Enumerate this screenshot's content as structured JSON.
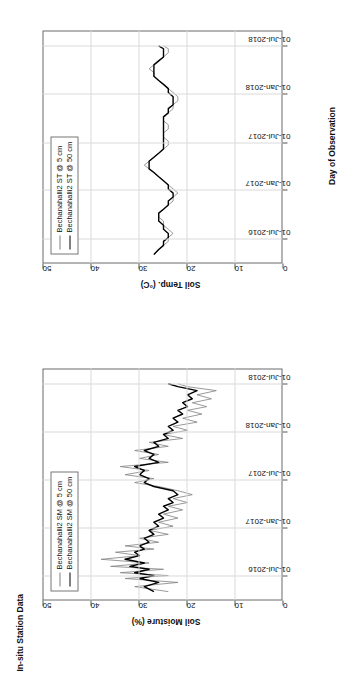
{
  "figure": {
    "title": "In-situ Station Data",
    "orientation": "rotated-90-ccw",
    "background": "#ffffff"
  },
  "colors": {
    "series_shallow": "#808080",
    "series_deep": "#000000",
    "axis": "#6b6b6b",
    "grid": "#d9d9d9",
    "text": "#111111"
  },
  "panels": [
    {
      "id": "soil-moisture",
      "title": "In-situ Station Data",
      "ylabel": "Soil Moisture (%)",
      "xlabel": "",
      "yticks": [
        "0",
        "10",
        "20",
        "30",
        "40",
        "50"
      ],
      "xticks": [
        "01-Jul-2016",
        "01-Jan-2017",
        "01-Jul-2017",
        "01-Jan-2018",
        "01-Jul-2018"
      ],
      "legend": [
        {
          "label": "Bechanahalli2 SM @ 5 cm",
          "color": "#808080"
        },
        {
          "label": "Bechanahalli2 SM @ 50 cm",
          "color": "#000000"
        }
      ]
    },
    {
      "id": "soil-temperature",
      "title": "",
      "ylabel": "Soil Temp. (°C)",
      "xlabel": "Day of Observation",
      "yticks": [
        "0",
        "10",
        "20",
        "30",
        "40",
        "50"
      ],
      "xticks": [
        "01-Jul-2016",
        "01-Jan-2017",
        "01-Jul-2017",
        "01-Jan-2018",
        "01-Jul-2018"
      ],
      "legend": [
        {
          "label": "Bechanahalli2 ST @ 5 cm",
          "color": "#808080"
        },
        {
          "label": "Bechanahalli2 ST @ 50 cm",
          "color": "#000000"
        }
      ]
    }
  ],
  "chart_data": [
    {
      "type": "line",
      "title": "In-situ Station Data",
      "xlabel": "",
      "ylabel": "Soil Moisture (%)",
      "ylim": [
        0,
        50
      ],
      "yticks": [
        0,
        10,
        20,
        30,
        40,
        50
      ],
      "xlim": [
        "2016-04-01",
        "2018-09-01"
      ],
      "xticks": [
        "01-Jul-2016",
        "01-Jan-2017",
        "01-Jul-2017",
        "01-Jan-2018",
        "01-Jul-2018"
      ],
      "grid": true,
      "legend_position": "top-left",
      "series": [
        {
          "name": "Bechanahalli2 SM @ 5 cm",
          "color": "#808080",
          "x": [
            "2016-05-01",
            "2016-05-20",
            "2016-06-05",
            "2016-06-20",
            "2016-07-01",
            "2016-07-12",
            "2016-07-25",
            "2016-08-05",
            "2016-08-18",
            "2016-09-01",
            "2016-09-15",
            "2016-09-28",
            "2016-10-10",
            "2016-10-22",
            "2016-11-05",
            "2016-11-20",
            "2016-12-05",
            "2016-12-20",
            "2017-01-05",
            "2017-01-20",
            "2017-02-05",
            "2017-02-20",
            "2017-03-08",
            "2017-03-22",
            "2017-04-05",
            "2017-04-20",
            "2017-05-05",
            "2017-05-20",
            "2017-06-05",
            "2017-06-20",
            "2017-07-05",
            "2017-07-20",
            "2017-08-05",
            "2017-08-20",
            "2017-09-05",
            "2017-09-20",
            "2017-10-05",
            "2017-10-20",
            "2017-11-05",
            "2017-11-20",
            "2017-12-05",
            "2017-12-20",
            "2018-01-05",
            "2018-01-20",
            "2018-02-05",
            "2018-02-20",
            "2018-03-08",
            "2018-03-22",
            "2018-04-05",
            "2018-04-20",
            "2018-05-05",
            "2018-05-20",
            "2018-06-05",
            "2018-06-20",
            "2018-07-01"
          ],
          "y": [
            24,
            31,
            22,
            33,
            24,
            34,
            25,
            36,
            28,
            38,
            30,
            35,
            27,
            33,
            26,
            30,
            24,
            28,
            23,
            26,
            22,
            25,
            21,
            24,
            20,
            23,
            19,
            22,
            26,
            31,
            27,
            33,
            28,
            34,
            24,
            30,
            26,
            31,
            24,
            28,
            21,
            25,
            20,
            23,
            18,
            21,
            17,
            20,
            16,
            19,
            15,
            18,
            14,
            20,
            22
          ]
        },
        {
          "name": "Bechanahalli2 SM @ 50 cm",
          "color": "#000000",
          "x": [
            "2016-05-01",
            "2016-05-20",
            "2016-06-05",
            "2016-06-20",
            "2016-07-01",
            "2016-07-12",
            "2016-07-25",
            "2016-08-05",
            "2016-08-18",
            "2016-09-01",
            "2016-09-15",
            "2016-09-28",
            "2016-10-10",
            "2016-10-22",
            "2016-11-05",
            "2016-11-20",
            "2016-12-05",
            "2016-12-20",
            "2017-01-05",
            "2017-01-20",
            "2017-02-05",
            "2017-02-20",
            "2017-03-08",
            "2017-03-22",
            "2017-04-05",
            "2017-04-20",
            "2017-05-05",
            "2017-05-20",
            "2017-06-05",
            "2017-06-20",
            "2017-07-05",
            "2017-07-20",
            "2017-08-05",
            "2017-08-20",
            "2017-09-05",
            "2017-09-20",
            "2017-10-05",
            "2017-10-20",
            "2017-11-05",
            "2017-11-20",
            "2017-12-05",
            "2017-12-20",
            "2018-01-05",
            "2018-01-20",
            "2018-02-05",
            "2018-02-20",
            "2018-03-08",
            "2018-03-22",
            "2018-04-05",
            "2018-04-20",
            "2018-05-05",
            "2018-05-20",
            "2018-06-05",
            "2018-06-20",
            "2018-07-01"
          ],
          "y": [
            27,
            29,
            26,
            30,
            27,
            31,
            28,
            32,
            29,
            33,
            30,
            31,
            29,
            30,
            28,
            29,
            27,
            28,
            26,
            27,
            25,
            26,
            24,
            25,
            23,
            24,
            22,
            23,
            27,
            29,
            28,
            30,
            29,
            31,
            26,
            28,
            27,
            29,
            26,
            27,
            24,
            25,
            23,
            24,
            22,
            23,
            21,
            22,
            20,
            21,
            19,
            20,
            18,
            22,
            24
          ]
        }
      ]
    },
    {
      "type": "line",
      "title": "",
      "xlabel": "Day of Observation",
      "ylabel": "Soil Temp. (°C)",
      "ylim": [
        0,
        50
      ],
      "yticks": [
        0,
        10,
        20,
        30,
        40,
        50
      ],
      "xlim": [
        "2016-04-01",
        "2018-09-01"
      ],
      "xticks": [
        "01-Jul-2016",
        "01-Jan-2017",
        "01-Jul-2017",
        "01-Jan-2018",
        "01-Jul-2018"
      ],
      "grid": true,
      "legend_position": "top-left",
      "series": [
        {
          "name": "Bechanahalli2 ST @ 5 cm",
          "color": "#808080",
          "x": [
            "2016-05-01",
            "2016-05-20",
            "2016-06-05",
            "2016-06-20",
            "2016-07-05",
            "2016-07-20",
            "2016-08-05",
            "2016-08-20",
            "2016-09-05",
            "2016-09-20",
            "2016-10-05",
            "2016-10-20",
            "2016-11-05",
            "2016-11-20",
            "2016-12-05",
            "2016-12-20",
            "2017-01-05",
            "2017-01-20",
            "2017-02-05",
            "2017-02-20",
            "2017-03-08",
            "2017-03-22",
            "2017-04-05",
            "2017-04-20",
            "2017-05-05",
            "2017-05-20",
            "2017-06-05",
            "2017-06-20",
            "2017-07-05",
            "2017-07-20",
            "2017-08-05",
            "2017-08-20",
            "2017-09-05",
            "2017-09-20",
            "2017-10-05",
            "2017-10-20",
            "2017-11-05",
            "2017-11-20",
            "2017-12-05",
            "2017-12-20",
            "2018-01-05",
            "2018-01-20",
            "2018-02-05",
            "2018-02-20",
            "2018-03-08",
            "2018-03-22",
            "2018-04-05",
            "2018-04-20",
            "2018-05-05",
            "2018-05-20",
            "2018-06-05",
            "2018-06-20",
            "2018-07-01"
          ],
          "y": [
            27,
            26,
            25,
            24,
            24,
            23,
            24,
            25,
            25,
            26,
            26,
            25,
            24,
            23,
            23,
            22,
            23,
            24,
            25,
            26,
            27,
            28,
            29,
            28,
            27,
            26,
            25,
            24,
            24,
            25,
            25,
            24,
            24,
            25,
            25,
            24,
            23,
            23,
            22,
            22,
            23,
            24,
            25,
            26,
            27,
            27,
            28,
            27,
            26,
            25,
            24,
            24,
            25
          ]
        },
        {
          "name": "Bechanahalli2 ST @ 50 cm",
          "color": "#000000",
          "x": [
            "2016-05-01",
            "2016-05-20",
            "2016-06-05",
            "2016-06-20",
            "2016-07-05",
            "2016-07-20",
            "2016-08-05",
            "2016-08-20",
            "2016-09-05",
            "2016-09-20",
            "2016-10-05",
            "2016-10-20",
            "2016-11-05",
            "2016-11-20",
            "2016-12-05",
            "2016-12-20",
            "2017-01-05",
            "2017-01-20",
            "2017-02-05",
            "2017-02-20",
            "2017-03-08",
            "2017-03-22",
            "2017-04-05",
            "2017-04-20",
            "2017-05-05",
            "2017-05-20",
            "2017-06-05",
            "2017-06-20",
            "2017-07-05",
            "2017-07-20",
            "2017-08-05",
            "2017-08-20",
            "2017-09-05",
            "2017-09-20",
            "2017-10-05",
            "2017-10-20",
            "2017-11-05",
            "2017-11-20",
            "2017-12-05",
            "2017-12-20",
            "2018-01-05",
            "2018-01-20",
            "2018-02-05",
            "2018-02-20",
            "2018-03-08",
            "2018-03-22",
            "2018-04-05",
            "2018-04-20",
            "2018-05-05",
            "2018-05-20",
            "2018-06-05",
            "2018-06-20",
            "2018-07-01"
          ],
          "y": [
            27,
            26,
            25,
            25,
            24,
            24,
            25,
            25,
            26,
            26,
            26,
            25,
            24,
            24,
            23,
            23,
            24,
            24,
            25,
            26,
            27,
            28,
            28,
            28,
            27,
            26,
            25,
            25,
            25,
            25,
            25,
            25,
            25,
            25,
            25,
            24,
            24,
            23,
            23,
            23,
            24,
            24,
            25,
            26,
            27,
            27,
            27,
            27,
            26,
            25,
            25,
            25,
            26
          ]
        }
      ]
    }
  ]
}
